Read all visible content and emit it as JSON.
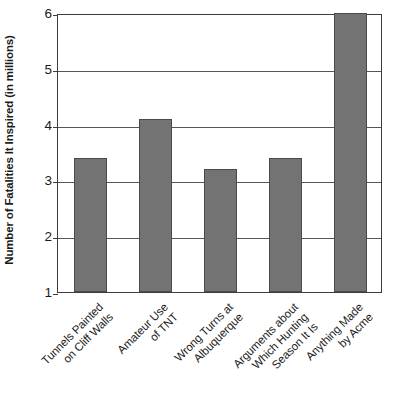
{
  "chart_data": {
    "type": "bar",
    "title": "",
    "xlabel": "",
    "ylabel": "Number of Fatalities It Inspired (in millions)",
    "categories": [
      "Tunnels Painted\non Cliff Walls",
      "Amateur Use\nof TNT",
      "Wrong Turns at\nAlbuquerque",
      "Arguments about\nWhich Hunting\nSeason It Is",
      "Anything Made\nby Acme"
    ],
    "values": [
      3.4,
      4.1,
      3.2,
      3.4,
      6.0
    ],
    "ylim": [
      1,
      6
    ],
    "yticks": [
      1,
      2,
      3,
      4,
      5,
      6
    ],
    "ytick_labels": [
      "1",
      "2",
      "3",
      "4",
      "5",
      "6"
    ],
    "grid": true,
    "legend": "none",
    "colors": {
      "bar_fill": "#737373",
      "bar_edge": "#4a4a4a",
      "grid": "#565656",
      "axis": "#3d3d3d",
      "text": "#1a1a1a",
      "background": "#ffffff"
    }
  }
}
